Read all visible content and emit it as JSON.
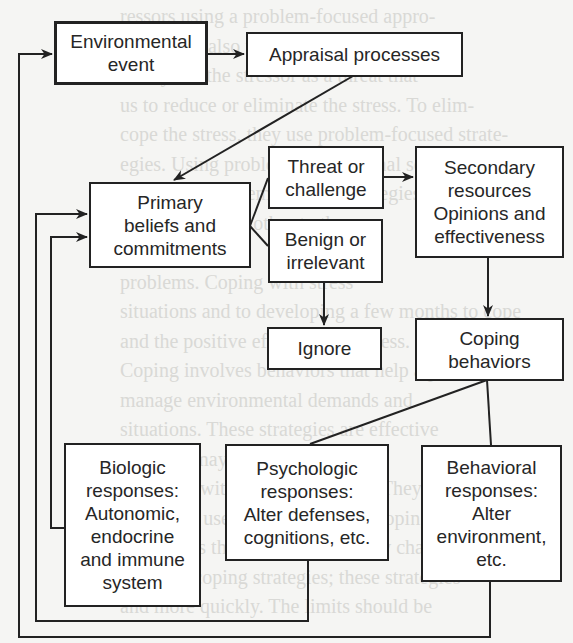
{
  "diagram": {
    "type": "flowchart",
    "title": "",
    "colors": {
      "line": "#222222",
      "box_fill": "#ffffff",
      "background": "#f5f5f3",
      "text": "#262626"
    },
    "nodes": {
      "environmental_event": {
        "label": "Environmental\nevent"
      },
      "appraisal_processes": {
        "label": "Appraisal processes"
      },
      "primary_beliefs": {
        "label": "Primary\nbeliefs and\ncommitments"
      },
      "threat_or_challenge": {
        "label": "Threat or\nchallenge"
      },
      "benign_or_irrelevant": {
        "label": "Benign or\nirrelevant"
      },
      "ignore": {
        "label": "Ignore"
      },
      "secondary_resources": {
        "label": "Secondary\nresources\nOpinions and\neffectiveness"
      },
      "coping_behaviors": {
        "label": "Coping\nbehaviors"
      },
      "biologic_responses": {
        "label": "Biologic\nresponses:\nAutonomic,\nendocrine\nand immune\nsystem"
      },
      "psychologic_responses": {
        "label": "Psychologic\nresponses:\nAlter defenses,\ncognitions, etc."
      },
      "behavioral_responses": {
        "label": "Behavioral\nresponses:\nAlter\nenvironment,\netc."
      }
    },
    "edges": [
      {
        "from": "Environmental event",
        "to": "Appraisal processes",
        "arrow": true
      },
      {
        "from": "Appraisal processes",
        "to": "Primary beliefs and commitments",
        "arrow": true
      },
      {
        "from": "Primary beliefs and commitments",
        "to": "Threat or challenge",
        "arrow": false
      },
      {
        "from": "Primary beliefs and commitments",
        "to": "Benign or irrelevant",
        "arrow": false
      },
      {
        "from": "Threat or challenge",
        "to": "Secondary resources",
        "arrow": true
      },
      {
        "from": "Benign or irrelevant",
        "to": "Ignore",
        "arrow": true
      },
      {
        "from": "Secondary resources",
        "to": "Coping behaviors",
        "arrow": true
      },
      {
        "from": "Coping behaviors",
        "to": "Psychologic responses",
        "arrow": false
      },
      {
        "from": "Coping behaviors",
        "to": "Behavioral responses",
        "arrow": false
      },
      {
        "from": "Biologic responses",
        "to": "Primary beliefs and commitments",
        "arrow": true,
        "route": "feedback-inner"
      },
      {
        "from": "Psychologic responses",
        "to": "Primary beliefs and commitments",
        "arrow": true,
        "route": "feedback-middle"
      },
      {
        "from": "Behavioral responses",
        "to": "Environmental event",
        "arrow": true,
        "route": "feedback-outer"
      }
    ]
  },
  "background_bleed_text": "ressors using a problem-focused appro-\nems. They also frequently use the\n. They see the stressor as a threat that\nus to reduce or eliminate the stress. To elim-\ncope the stress, they use problem-focused strate-\negies. Using problem-focused final solutions\nresult that problem-focused strategies cause\nthe more for the other to the\n\nproblems. Coping with stress\nsituations and to developing a few months to cope\nand the positive effects of the stress.\nCoping involves behaviors that help a person\nmanage environmental demands and\nsituations. These strategies are effective\nand they may be of some benefit\nin coping with the environment. They are\nmany and use in problems. The coping\nnot always the best of these. They change\nfocus on coping strategies; these strategies\nand more quickly. The limits should be"
}
